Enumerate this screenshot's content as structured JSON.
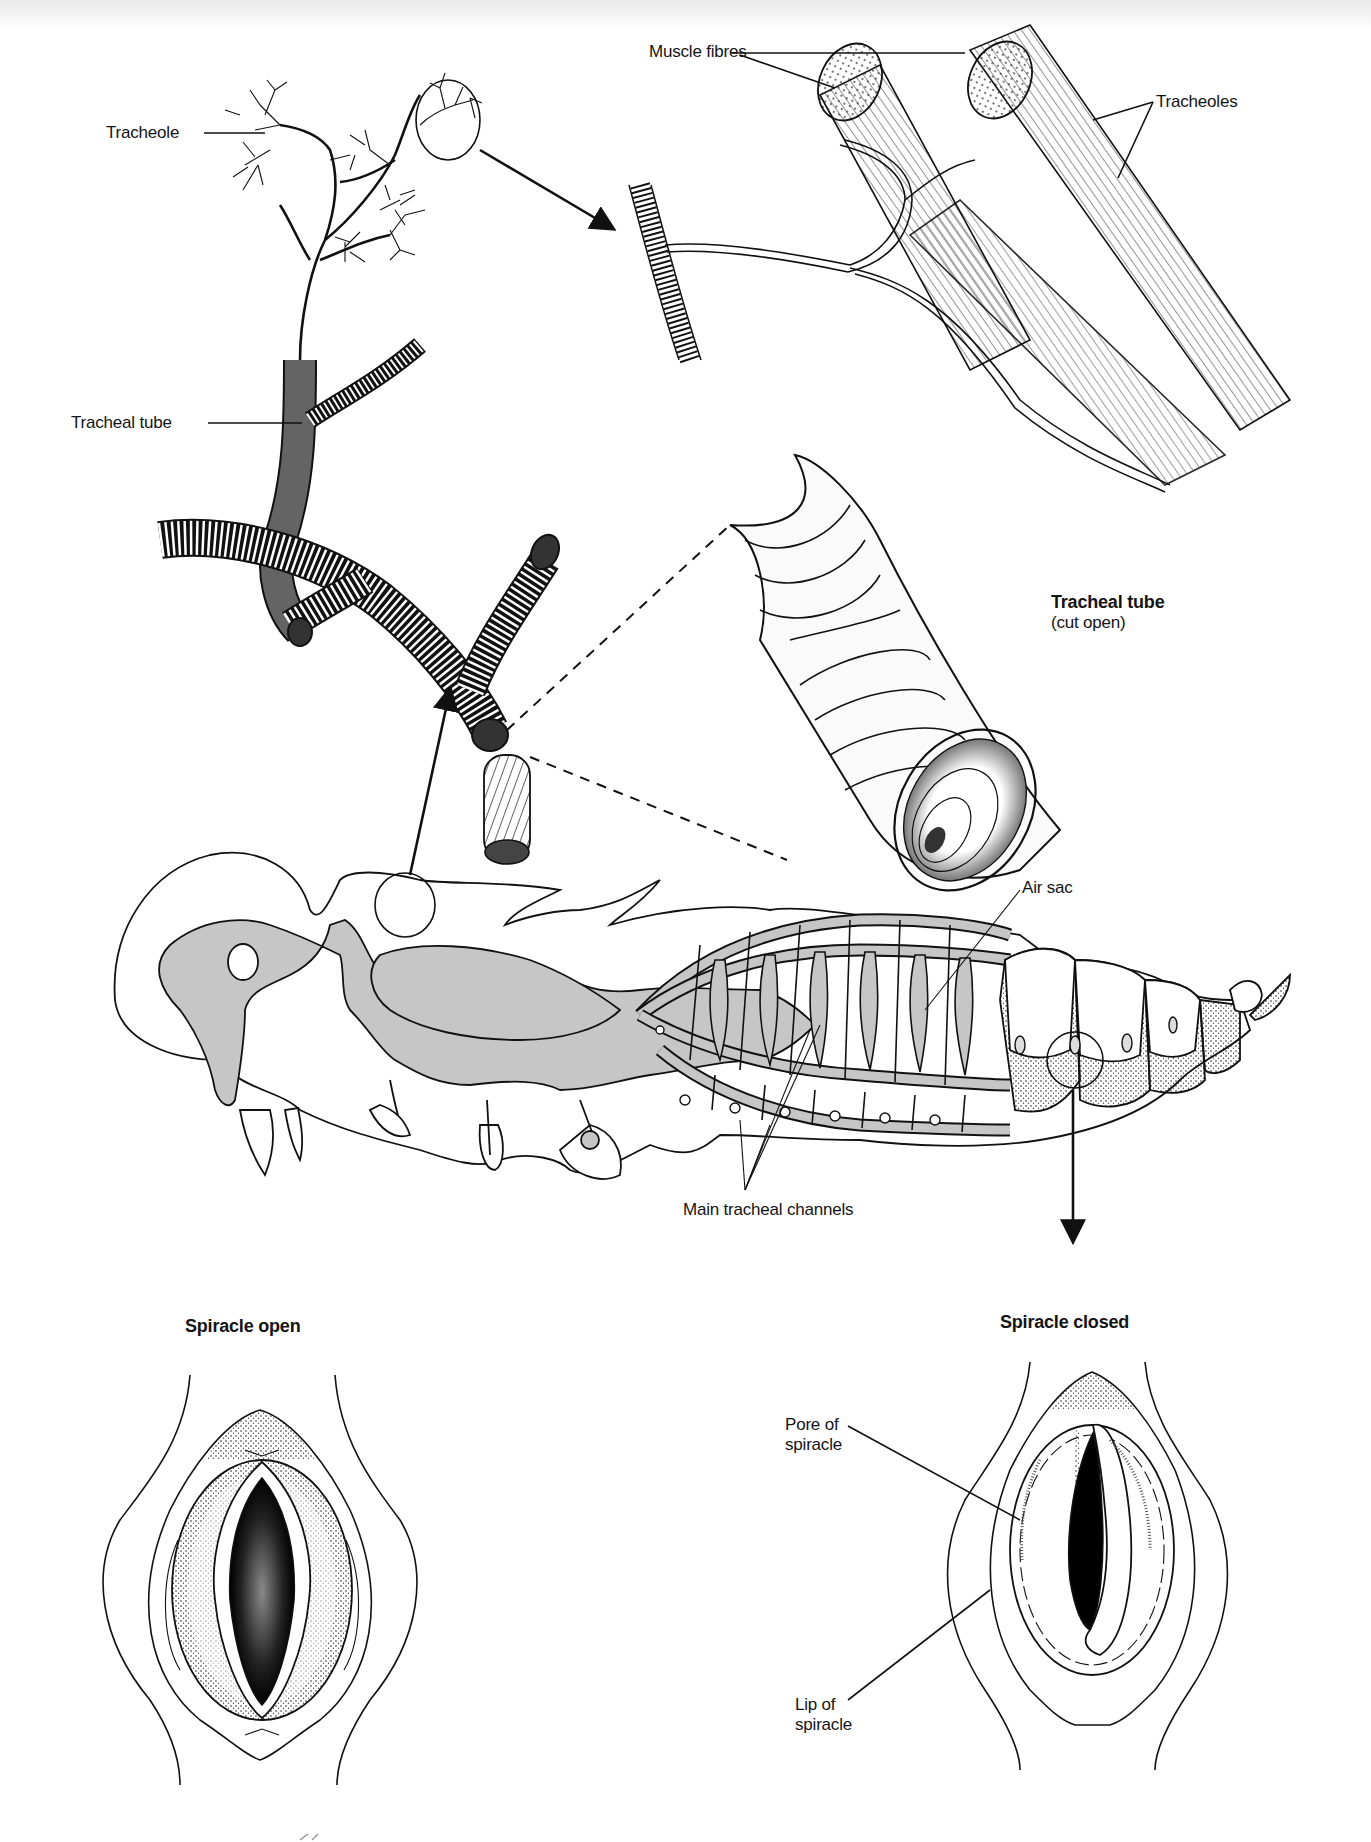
{
  "figure": {
    "colors": {
      "ink": "#111111",
      "air_sac_fill": "#c6c6c6",
      "background": "#ffffff"
    }
  },
  "labels": {
    "tracheole": "Tracheole",
    "tracheal_tube": "Tracheal tube",
    "muscle_fibres": "Muscle fibres",
    "tracheoles": "Tracheoles",
    "tracheal_tube_cut_title": "Tracheal tube",
    "tracheal_tube_cut_sub": "(cut open)",
    "air_sac": "Air sac",
    "main_tracheal_channels": "Main tracheal channels",
    "spiracle_open": "Spiracle open",
    "spiracle_closed": "Spiracle closed",
    "pore_of_spiracle": "Pore of spiracle",
    "lip_of_spiracle": "Lip of spiracle"
  },
  "panels": [
    {
      "id": "tracheole-network",
      "label": "Tracheole"
    },
    {
      "id": "muscle-detail",
      "labels": [
        "Muscle fibres",
        "Tracheoles"
      ]
    },
    {
      "id": "tracheal-tube-branching",
      "label": "Tracheal tube"
    },
    {
      "id": "tracheal-tube-cutaway",
      "label": "Tracheal tube (cut open)"
    },
    {
      "id": "insect-body",
      "labels": [
        "Air sac",
        "Main tracheal channels"
      ]
    },
    {
      "id": "spiracle-open",
      "label": "Spiracle open"
    },
    {
      "id": "spiracle-closed",
      "labels": [
        "Spiracle closed",
        "Pore of spiracle",
        "Lip of spiracle"
      ]
    }
  ]
}
